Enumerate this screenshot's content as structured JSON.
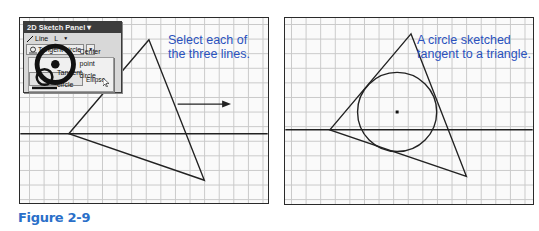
{
  "figure": {
    "label": "Figure 2-9",
    "label_color": "#2a6fc9",
    "caption_color": "#2a52be"
  },
  "left_panel": {
    "caption": "Select each of the three lines.",
    "toolbar": {
      "title": "2D Sketch Panel",
      "title_arrow": "▾",
      "line_tool": {
        "label": "Line",
        "shortcut": "L",
        "icon": "line-icon"
      },
      "active_tool": {
        "label": "Tangent circle",
        "icon": "tangent-circle-icon"
      },
      "menu_items": [
        {
          "label": "Center point circle",
          "icon": "center-point-circle-icon",
          "highlighted": false
        },
        {
          "label": "Tangent circle",
          "icon": "tangent-circle-icon",
          "highlighted": true
        },
        {
          "label": "Ellipse",
          "icon": "ellipse-icon",
          "highlighted": false
        }
      ]
    },
    "triangle": {
      "vertices": [
        [
          130,
          22
        ],
        [
          49,
          117
        ],
        [
          186,
          164
        ]
      ]
    },
    "horizontal_line_y": 117,
    "arrow": {
      "from": [
        159,
        87
      ],
      "to": [
        213,
        87
      ]
    }
  },
  "right_panel": {
    "caption": "A circle sketched tangent to a triangle.",
    "triangle": {
      "vertices": [
        [
          127,
          16
        ],
        [
          45,
          113
        ],
        [
          183,
          160
        ]
      ]
    },
    "horizontal_line_y": 113,
    "circle": {
      "cx": 113,
      "cy": 95,
      "r": 40
    }
  }
}
